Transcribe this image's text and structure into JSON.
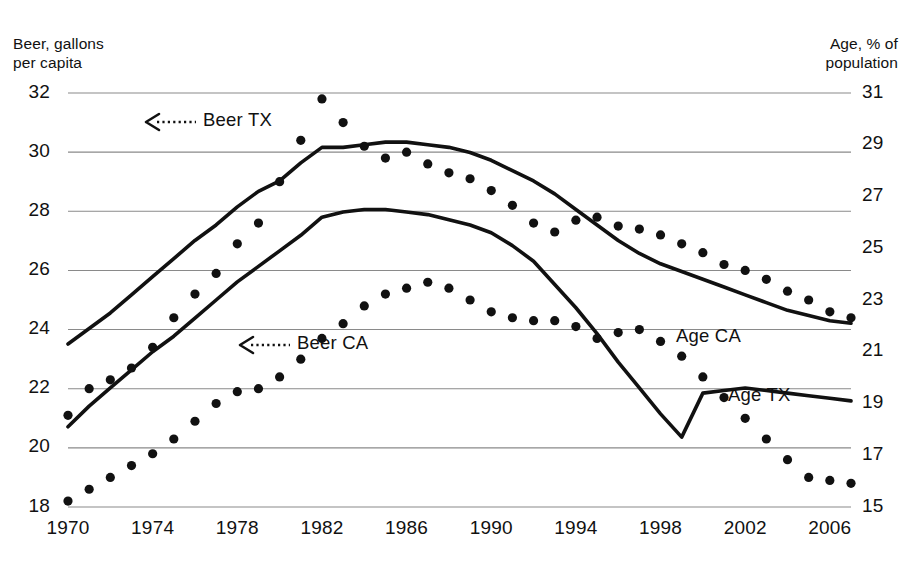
{
  "chart_data": {
    "type": "line",
    "title": "",
    "subtitle": "",
    "ylabel": "Beer, gallons\nper capita",
    "ylabel_right": "Age, % of\npopulation",
    "xlabel": "",
    "grid": true,
    "legend_position": "inline-annotations",
    "xlim": [
      1970,
      2007
    ],
    "ylim": [
      18,
      32
    ],
    "ylim_right": [
      15,
      31
    ],
    "xticks": [
      1970,
      1974,
      1978,
      1982,
      1986,
      1990,
      1994,
      1998,
      2002,
      2006
    ],
    "yticks_left": [
      18,
      20,
      22,
      24,
      26,
      28,
      30,
      32
    ],
    "yticks_right": [
      15,
      17,
      19,
      21,
      23,
      25,
      27,
      29,
      31
    ],
    "x": [
      1970,
      1971,
      1972,
      1973,
      1974,
      1975,
      1976,
      1977,
      1978,
      1979,
      1980,
      1981,
      1982,
      1983,
      1984,
      1985,
      1986,
      1987,
      1988,
      1989,
      1990,
      1991,
      1992,
      1993,
      1994,
      1995,
      1996,
      1997,
      1998,
      1999,
      2000,
      2001,
      2002,
      2003,
      2004,
      2005,
      2006,
      2007
    ],
    "series": [
      {
        "name": "Beer TX",
        "axis": "left",
        "style": "dotted",
        "units": "gallons per capita",
        "values": [
          21.1,
          22.0,
          22.3,
          22.7,
          23.4,
          24.4,
          25.2,
          25.9,
          26.9,
          27.6,
          29.0,
          30.4,
          31.8,
          31.0,
          30.2,
          29.8,
          30.0,
          29.6,
          29.3,
          29.1,
          28.7,
          28.2,
          27.6,
          27.3,
          27.7,
          27.8,
          27.5,
          27.4,
          27.2,
          26.9,
          26.6,
          26.2,
          26.0,
          25.7,
          25.3,
          25.0,
          24.6,
          24.4
        ]
      },
      {
        "name": "Beer CA",
        "axis": "left",
        "style": "dotted",
        "units": "gallons per capita",
        "values": [
          18.2,
          18.6,
          19.0,
          19.4,
          19.8,
          20.3,
          20.9,
          21.5,
          21.9,
          22.0,
          22.4,
          23.0,
          23.7,
          24.2,
          24.8,
          25.2,
          25.4,
          25.6,
          25.4,
          25.0,
          24.6,
          24.4,
          24.3,
          24.3,
          24.1,
          23.7,
          23.9,
          24.0,
          23.6,
          23.1,
          22.4,
          21.7,
          21.0,
          20.3,
          19.6,
          19.0,
          18.9,
          18.8
        ]
      },
      {
        "name": "Age CA",
        "axis": "right",
        "style": "solid",
        "units": "% of population",
        "values": [
          21.3,
          21.9,
          22.5,
          23.2,
          23.9,
          24.6,
          25.3,
          25.9,
          26.6,
          27.2,
          27.6,
          28.3,
          28.9,
          28.9,
          29.0,
          29.1,
          29.1,
          29.0,
          28.9,
          28.7,
          28.4,
          28.0,
          27.6,
          27.1,
          26.5,
          25.9,
          25.3,
          24.8,
          24.4,
          24.1,
          23.8,
          23.5,
          23.2,
          22.9,
          22.6,
          22.4,
          22.2,
          22.1
        ]
      },
      {
        "name": "Age TX",
        "axis": "right",
        "style": "solid",
        "units": "% of population",
        "values": [
          18.1,
          18.9,
          19.6,
          20.3,
          21.0,
          21.6,
          22.3,
          23.0,
          23.7,
          24.3,
          24.9,
          25.5,
          26.2,
          26.4,
          26.5,
          26.5,
          26.4,
          26.3,
          26.1,
          25.9,
          25.6,
          25.1,
          24.5,
          23.6,
          22.7,
          21.7,
          20.6,
          19.6,
          18.6,
          17.7,
          19.4,
          19.5,
          19.6,
          19.5,
          19.4,
          19.3,
          19.2,
          19.1
        ]
      }
    ],
    "annotations": [
      {
        "id": "beer-tx",
        "text": "Beer TX",
        "arrow": "left-dotted",
        "target_series": "Beer TX"
      },
      {
        "id": "beer-ca",
        "text": "Beer CA",
        "arrow": "left-dotted",
        "target_series": "Beer CA"
      },
      {
        "id": "age-ca",
        "text": "Age CA",
        "arrow": "none",
        "target_series": "Age CA"
      },
      {
        "id": "age-tx",
        "text": "Age TX",
        "arrow": "none",
        "target_series": "Age TX"
      }
    ],
    "colors": {
      "line": "#111111",
      "dot": "#111111",
      "grid": "#8a8a8a",
      "background": "#ffffff",
      "text": "#111111"
    }
  }
}
